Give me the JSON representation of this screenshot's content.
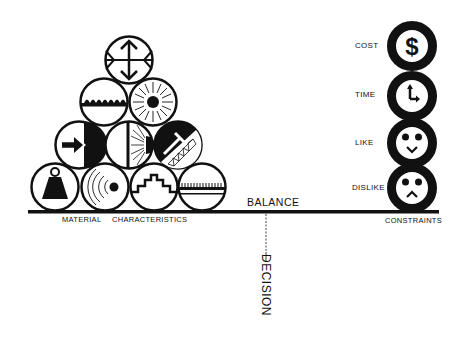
{
  "diagram": {
    "center_label": "BALANCE",
    "decision_label": "DECISION",
    "left_group": {
      "caption_1": "MATERIAL",
      "caption_2": "CHARACTERISTICS",
      "icons": [
        {
          "row": 1,
          "name": "expansion-arrows-icon"
        },
        {
          "row": 2,
          "name": "water-surface-icon"
        },
        {
          "row": 2,
          "name": "radiant-sun-icon"
        },
        {
          "row": 3,
          "name": "penetration-arrow-icon"
        },
        {
          "row": 3,
          "name": "light-transmission-icon"
        },
        {
          "row": 3,
          "name": "structure-truss-icon"
        },
        {
          "row": 4,
          "name": "weight-icon"
        },
        {
          "row": 4,
          "name": "sound-waves-icon"
        },
        {
          "row": 4,
          "name": "stepped-profile-icon"
        },
        {
          "row": 4,
          "name": "texture-surface-icon"
        }
      ]
    },
    "right_group": {
      "caption": "CONSTRAINTS",
      "items": [
        {
          "label": "COST",
          "icon": "dollar-icon"
        },
        {
          "label": "TIME",
          "icon": "clock-icon"
        },
        {
          "label": "LIKE",
          "icon": "happy-face-icon"
        },
        {
          "label": "DISLIKE",
          "icon": "sad-face-icon"
        }
      ]
    },
    "colors": {
      "ink": "#111111",
      "paper": "#ffffff"
    }
  }
}
